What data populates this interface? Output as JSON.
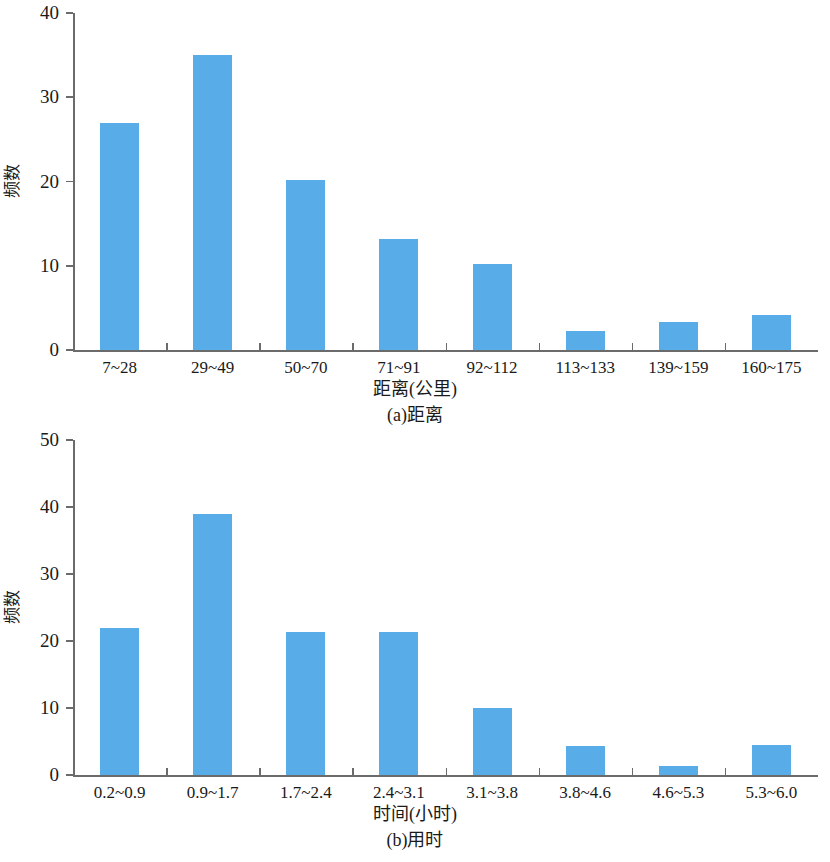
{
  "figure": {
    "y_axis_label": "频数",
    "panels": [
      {
        "id": "a",
        "caption": "(a)距离",
        "xlabel": "距离(公里)",
        "ylabel": "频数",
        "bar_color": "#58ade8",
        "axis_color": "#6b6b6b",
        "ymin": 0,
        "ymax": 40,
        "yticks": [
          0,
          10,
          20,
          30,
          40
        ],
        "ytick_labels": [
          "0",
          "10",
          "20",
          "30",
          "40"
        ],
        "categories": [
          "7~28",
          "29~49",
          "50~70",
          "71~91",
          "92~112",
          "113~133",
          "139~159",
          "160~175"
        ],
        "values": [
          27,
          35,
          20.2,
          13.2,
          10.2,
          2.2,
          3.3,
          4.2
        ]
      },
      {
        "id": "b",
        "caption": "(b)用时",
        "xlabel": "时间(小时)",
        "ylabel": "频数",
        "bar_color": "#58ade8",
        "axis_color": "#6b6b6b",
        "ymin": 0,
        "ymax": 50,
        "yticks": [
          0,
          10,
          20,
          30,
          40,
          50
        ],
        "ytick_labels": [
          "0",
          "10",
          "20",
          "30",
          "40",
          "50"
        ],
        "categories": [
          "0.2~0.9",
          "0.9~1.7",
          "1.7~2.4",
          "2.4~3.1",
          "3.1~3.8",
          "3.8~4.6",
          "4.6~5.3",
          "5.3~6.0"
        ],
        "values": [
          22,
          39,
          21.3,
          21.4,
          10,
          4.3,
          1.3,
          4.5
        ]
      }
    ]
  },
  "chart_data": [
    {
      "type": "bar",
      "title": "(a)距离",
      "xlabel": "距离(公里)",
      "ylabel": "频数",
      "categories": [
        "7~28",
        "29~49",
        "50~70",
        "71~91",
        "92~112",
        "113~133",
        "139~159",
        "160~175"
      ],
      "values": [
        27,
        35,
        20.2,
        13.2,
        10.2,
        2.2,
        3.3,
        4.2
      ],
      "ylim": [
        0,
        40
      ],
      "yticks": [
        0,
        10,
        20,
        30,
        40
      ],
      "grid": false,
      "legend": "none",
      "series_color": "#58ade8"
    },
    {
      "type": "bar",
      "title": "(b)用时",
      "xlabel": "时间(小时)",
      "ylabel": "频数",
      "categories": [
        "0.2~0.9",
        "0.9~1.7",
        "1.7~2.4",
        "2.4~3.1",
        "3.1~3.8",
        "3.8~4.6",
        "4.6~5.3",
        "5.3~6.0"
      ],
      "values": [
        22,
        39,
        21.3,
        21.4,
        10,
        4.3,
        1.3,
        4.5
      ],
      "ylim": [
        0,
        50
      ],
      "yticks": [
        0,
        10,
        20,
        30,
        40,
        50
      ],
      "grid": false,
      "legend": "none",
      "series_color": "#58ade8"
    }
  ]
}
